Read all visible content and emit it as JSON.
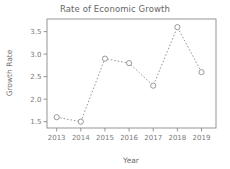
{
  "chart_data": {
    "type": "line",
    "title": "Rate of Economic Growth",
    "xlabel": "Year",
    "ylabel": "Growth Rate",
    "categories": [
      "2013",
      "2014",
      "2015",
      "2016",
      "2017",
      "2018",
      "2019"
    ],
    "x": [
      2013,
      2014,
      2015,
      2016,
      2017,
      2018,
      2019
    ],
    "values": [
      1.6,
      1.5,
      2.9,
      2.8,
      2.3,
      3.6,
      2.6
    ],
    "series": [
      {
        "name": "Growth Rate",
        "values": [
          1.6,
          1.5,
          2.9,
          2.8,
          2.3,
          3.6,
          2.6
        ]
      }
    ],
    "xlim": [
      2012.6,
      2019.6
    ],
    "ylim": [
      1.36,
      3.78
    ],
    "yticks": [
      1.5,
      2.0,
      2.5,
      3.0,
      3.5
    ],
    "ytick_labels": [
      "1.5",
      "2.0",
      "2.5",
      "3.0",
      "3.5"
    ],
    "xticks": [
      2013,
      2014,
      2015,
      2016,
      2017,
      2018,
      2019
    ],
    "xtick_labels": [
      "2013",
      "2014",
      "2015",
      "2016",
      "2017",
      "2018",
      "2019"
    ],
    "grid": false,
    "legend": false,
    "legend_position": "none",
    "line_style": "dotted",
    "marker": "open-circle",
    "colors": {
      "line": "#8d8d8d",
      "marker_fill": "#ffffff",
      "axis": "#8a8a8a",
      "text": "#6e6e6e",
      "background": "#ffffff"
    }
  }
}
